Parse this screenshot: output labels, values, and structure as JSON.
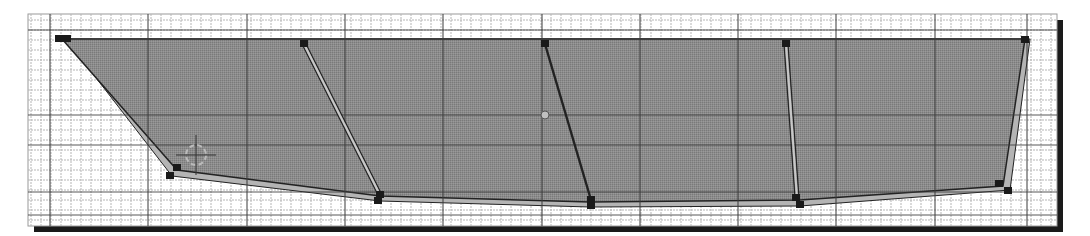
{
  "viewport": {
    "name": "2D side-view modeling viewport",
    "frame": {
      "x": 28,
      "y": 14,
      "w": 1029,
      "h": 212
    },
    "shadow_color": "#1a1a1a",
    "background": "#ffffff",
    "grid": {
      "minor_spacing": 10,
      "minor_color": "#b5b5b5",
      "major_color": "#3c3c3c",
      "major_x": [
        50,
        148,
        247,
        345,
        443,
        542,
        640,
        738,
        836,
        935,
        1027
      ],
      "major_y": [
        30,
        115,
        145,
        192,
        215
      ]
    }
  },
  "hull": {
    "fill_color": "#8a8a8a",
    "edge_band_color": "#b4b4b4",
    "edge_line_color": "#222222",
    "outline_top": [
      [
        62,
        39
      ],
      [
        1025,
        39
      ]
    ],
    "profile_points": [
      [
        62,
        39
      ],
      [
        1025,
        39
      ],
      [
        1003,
        186
      ],
      [
        800,
        200
      ],
      [
        590,
        202
      ],
      [
        380,
        196
      ],
      [
        177,
        170
      ]
    ],
    "outer_band_points": [
      [
        66,
        39
      ],
      [
        1030,
        39
      ],
      [
        1010,
        190
      ],
      [
        800,
        206
      ],
      [
        590,
        207
      ],
      [
        380,
        201
      ],
      [
        172,
        176
      ]
    ],
    "vertices": [
      {
        "id": "bow-top-a",
        "x": 59,
        "y": 39
      },
      {
        "id": "bow-top-b",
        "x": 67,
        "y": 39
      },
      {
        "id": "bow-bottom-a",
        "x": 177,
        "y": 168
      },
      {
        "id": "bow-bottom-b",
        "x": 170,
        "y": 176
      },
      {
        "id": "station-1-top",
        "x": 304,
        "y": 44
      },
      {
        "id": "station-1-bottom",
        "x": 380,
        "y": 195
      },
      {
        "id": "station-1-bottom-b",
        "x": 378,
        "y": 201
      },
      {
        "id": "station-2-top",
        "x": 545,
        "y": 44
      },
      {
        "id": "station-2-bottom",
        "x": 591,
        "y": 200
      },
      {
        "id": "station-2-bottom-b",
        "x": 591,
        "y": 206
      },
      {
        "id": "station-3-top",
        "x": 786,
        "y": 44
      },
      {
        "id": "station-3-bottom",
        "x": 796,
        "y": 198
      },
      {
        "id": "station-3-bottom-b",
        "x": 800,
        "y": 205
      },
      {
        "id": "stern-top",
        "x": 1025,
        "y": 40
      },
      {
        "id": "stern-bottom-a",
        "x": 999,
        "y": 184
      },
      {
        "id": "stern-bottom-b",
        "x": 1008,
        "y": 191
      }
    ],
    "stations": [
      {
        "id": "station-1",
        "from": [
          304,
          44
        ],
        "to": [
          380,
          195
        ],
        "double": true
      },
      {
        "id": "station-2",
        "from": [
          545,
          44
        ],
        "to": [
          591,
          200
        ],
        "double": false
      },
      {
        "id": "station-3",
        "from": [
          786,
          44
        ],
        "to": [
          797,
          198
        ],
        "double": true
      }
    ]
  },
  "pivot": {
    "x": 545,
    "y": 115,
    "r": 4
  },
  "cursor_3d": {
    "x": 196,
    "y": 155,
    "r": 10
  }
}
